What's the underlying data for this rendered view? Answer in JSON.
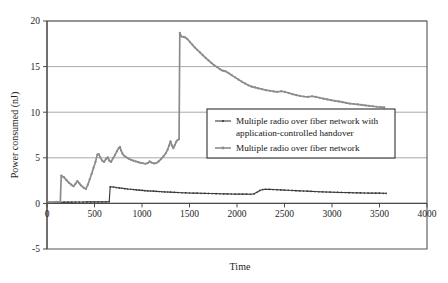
{
  "chart_data": {
    "type": "line",
    "title": "",
    "xlabel": "Time",
    "ylabel": "Power consumed (nJ)",
    "xlim": [
      0,
      4000
    ],
    "ylim": [
      -5,
      20
    ],
    "xticks": [
      0,
      500,
      1000,
      1500,
      2000,
      2500,
      3000,
      3500,
      4000
    ],
    "xtick_labels": [
      "0",
      "500",
      "1000",
      "1500",
      "2000",
      "2500",
      "3000",
      "3500",
      "4000"
    ],
    "yticks": [
      -5,
      0,
      5,
      10,
      15,
      20
    ],
    "ytick_labels": [
      "-5",
      "0",
      "5",
      "10",
      "15",
      "20"
    ],
    "grid": "horizontal",
    "legend_position": "center-right",
    "colors": {
      "series_a": "#3b3b3b",
      "series_b": "#8c8c8c",
      "grid": "#8d8d8d",
      "frame": "#555555",
      "background": "#ffffff"
    },
    "series": [
      {
        "name": "Multiple radio over fiber network with application-controlled handover",
        "marker": "plus",
        "color": "#3b3b3b",
        "points": [
          [
            20,
            0.12
          ],
          [
            60,
            0.12
          ],
          [
            100,
            0.12
          ],
          [
            140,
            0.12
          ],
          [
            180,
            0.14
          ],
          [
            220,
            0.14
          ],
          [
            260,
            0.14
          ],
          [
            300,
            0.15
          ],
          [
            340,
            0.15
          ],
          [
            380,
            0.15
          ],
          [
            420,
            0.16
          ],
          [
            460,
            0.16
          ],
          [
            500,
            0.16
          ],
          [
            540,
            0.17
          ],
          [
            580,
            0.17
          ],
          [
            620,
            0.17
          ],
          [
            655,
            0.18
          ],
          [
            665,
            1.82
          ],
          [
            700,
            1.8
          ],
          [
            730,
            1.74
          ],
          [
            760,
            1.7
          ],
          [
            790,
            1.66
          ],
          [
            820,
            1.62
          ],
          [
            850,
            1.58
          ],
          [
            880,
            1.55
          ],
          [
            910,
            1.52
          ],
          [
            940,
            1.49
          ],
          [
            970,
            1.46
          ],
          [
            1000,
            1.43
          ],
          [
            1030,
            1.4
          ],
          [
            1060,
            1.38
          ],
          [
            1090,
            1.36
          ],
          [
            1120,
            1.34
          ],
          [
            1150,
            1.32
          ],
          [
            1180,
            1.3
          ],
          [
            1210,
            1.28
          ],
          [
            1240,
            1.26
          ],
          [
            1270,
            1.25
          ],
          [
            1300,
            1.23
          ],
          [
            1340,
            1.21
          ],
          [
            1380,
            1.19
          ],
          [
            1420,
            1.17
          ],
          [
            1460,
            1.16
          ],
          [
            1500,
            1.14
          ],
          [
            1540,
            1.13
          ],
          [
            1580,
            1.12
          ],
          [
            1620,
            1.11
          ],
          [
            1660,
            1.1
          ],
          [
            1700,
            1.09
          ],
          [
            1740,
            1.08
          ],
          [
            1780,
            1.07
          ],
          [
            1820,
            1.06
          ],
          [
            1860,
            1.05
          ],
          [
            1900,
            1.04
          ],
          [
            1940,
            1.03
          ],
          [
            1980,
            1.02
          ],
          [
            2020,
            1.02
          ],
          [
            2060,
            1.01
          ],
          [
            2100,
            1.01
          ],
          [
            2140,
            1.0
          ],
          [
            2180,
            1.05
          ],
          [
            2210,
            1.22
          ],
          [
            2240,
            1.42
          ],
          [
            2270,
            1.52
          ],
          [
            2300,
            1.55
          ],
          [
            2340,
            1.54
          ],
          [
            2380,
            1.52
          ],
          [
            2420,
            1.5
          ],
          [
            2460,
            1.48
          ],
          [
            2500,
            1.46
          ],
          [
            2540,
            1.44
          ],
          [
            2580,
            1.42
          ],
          [
            2620,
            1.4
          ],
          [
            2660,
            1.38
          ],
          [
            2700,
            1.36
          ],
          [
            2740,
            1.34
          ],
          [
            2780,
            1.32
          ],
          [
            2820,
            1.3
          ],
          [
            2860,
            1.28
          ],
          [
            2900,
            1.27
          ],
          [
            2940,
            1.25
          ],
          [
            2980,
            1.24
          ],
          [
            3020,
            1.22
          ],
          [
            3060,
            1.21
          ],
          [
            3100,
            1.2
          ],
          [
            3140,
            1.19
          ],
          [
            3180,
            1.18
          ],
          [
            3220,
            1.17
          ],
          [
            3260,
            1.16
          ],
          [
            3300,
            1.15
          ],
          [
            3340,
            1.14
          ],
          [
            3380,
            1.13
          ],
          [
            3420,
            1.13
          ],
          [
            3460,
            1.12
          ],
          [
            3500,
            1.12
          ],
          [
            3540,
            1.11
          ],
          [
            3570,
            1.11
          ]
        ]
      },
      {
        "name": "Multiple radio over fiber network",
        "marker": "plus",
        "color": "#8c8c8c",
        "points": [
          [
            20,
            0.15
          ],
          [
            60,
            0.15
          ],
          [
            100,
            0.16
          ],
          [
            140,
            0.17
          ],
          [
            150,
            3.05
          ],
          [
            180,
            2.85
          ],
          [
            205,
            2.55
          ],
          [
            230,
            2.28
          ],
          [
            255,
            2.05
          ],
          [
            280,
            1.88
          ],
          [
            300,
            2.15
          ],
          [
            320,
            2.45
          ],
          [
            340,
            2.2
          ],
          [
            360,
            1.95
          ],
          [
            385,
            1.72
          ],
          [
            410,
            1.58
          ],
          [
            430,
            2.05
          ],
          [
            450,
            2.65
          ],
          [
            470,
            3.25
          ],
          [
            490,
            3.9
          ],
          [
            510,
            4.55
          ],
          [
            530,
            5.35
          ],
          [
            545,
            5.4
          ],
          [
            560,
            5.05
          ],
          [
            580,
            4.7
          ],
          [
            600,
            4.55
          ],
          [
            620,
            4.85
          ],
          [
            640,
            5.05
          ],
          [
            655,
            4.7
          ],
          [
            675,
            4.55
          ],
          [
            695,
            4.95
          ],
          [
            715,
            5.3
          ],
          [
            735,
            5.7
          ],
          [
            755,
            6.05
          ],
          [
            768,
            6.2
          ],
          [
            780,
            5.8
          ],
          [
            795,
            5.45
          ],
          [
            815,
            5.2
          ],
          [
            835,
            5.05
          ],
          [
            860,
            4.9
          ],
          [
            885,
            4.78
          ],
          [
            910,
            4.68
          ],
          [
            935,
            4.6
          ],
          [
            960,
            4.52
          ],
          [
            985,
            4.45
          ],
          [
            1010,
            4.4
          ],
          [
            1035,
            4.35
          ],
          [
            1060,
            4.42
          ],
          [
            1080,
            4.6
          ],
          [
            1100,
            4.48
          ],
          [
            1125,
            4.38
          ],
          [
            1150,
            4.42
          ],
          [
            1175,
            4.6
          ],
          [
            1200,
            4.85
          ],
          [
            1225,
            5.15
          ],
          [
            1250,
            5.5
          ],
          [
            1270,
            5.9
          ],
          [
            1285,
            6.35
          ],
          [
            1300,
            6.8
          ],
          [
            1315,
            6.35
          ],
          [
            1330,
            6.05
          ],
          [
            1345,
            6.4
          ],
          [
            1360,
            6.75
          ],
          [
            1375,
            6.95
          ],
          [
            1390,
            7.05
          ],
          [
            1398,
            18.7
          ],
          [
            1415,
            18.3
          ],
          [
            1435,
            18.25
          ],
          [
            1455,
            18.2
          ],
          [
            1480,
            18.0
          ],
          [
            1505,
            17.7
          ],
          [
            1530,
            17.4
          ],
          [
            1555,
            17.1
          ],
          [
            1580,
            16.85
          ],
          [
            1610,
            16.55
          ],
          [
            1640,
            16.25
          ],
          [
            1670,
            15.95
          ],
          [
            1700,
            15.68
          ],
          [
            1730,
            15.4
          ],
          [
            1760,
            15.15
          ],
          [
            1790,
            14.95
          ],
          [
            1820,
            14.72
          ],
          [
            1850,
            14.55
          ],
          [
            1880,
            14.48
          ],
          [
            1910,
            14.3
          ],
          [
            1945,
            14.05
          ],
          [
            1980,
            13.82
          ],
          [
            2015,
            13.58
          ],
          [
            2050,
            13.35
          ],
          [
            2085,
            13.15
          ],
          [
            2120,
            12.95
          ],
          [
            2155,
            12.8
          ],
          [
            2190,
            12.72
          ],
          [
            2225,
            12.62
          ],
          [
            2265,
            12.52
          ],
          [
            2305,
            12.42
          ],
          [
            2345,
            12.35
          ],
          [
            2385,
            12.28
          ],
          [
            2425,
            12.22
          ],
          [
            2465,
            12.3
          ],
          [
            2505,
            12.22
          ],
          [
            2545,
            12.1
          ],
          [
            2585,
            11.98
          ],
          [
            2625,
            11.88
          ],
          [
            2665,
            11.78
          ],
          [
            2705,
            11.72
          ],
          [
            2745,
            11.68
          ],
          [
            2790,
            11.75
          ],
          [
            2830,
            11.68
          ],
          [
            2870,
            11.58
          ],
          [
            2910,
            11.48
          ],
          [
            2950,
            11.4
          ],
          [
            2990,
            11.32
          ],
          [
            3030,
            11.25
          ],
          [
            3070,
            11.18
          ],
          [
            3110,
            11.1
          ],
          [
            3150,
            11.02
          ],
          [
            3190,
            10.95
          ],
          [
            3230,
            10.9
          ],
          [
            3270,
            10.85
          ],
          [
            3310,
            10.8
          ],
          [
            3350,
            10.75
          ],
          [
            3390,
            10.7
          ],
          [
            3430,
            10.65
          ],
          [
            3470,
            10.6
          ],
          [
            3510,
            10.56
          ],
          [
            3550,
            10.52
          ]
        ]
      }
    ],
    "legend_entries": [
      {
        "label_lines": [
          "Multiple radio over fiber network with",
          "application-controlled handover"
        ],
        "color": "#3b3b3b"
      },
      {
        "label_lines": [
          "Multiple radio over fiber network"
        ],
        "color": "#8c8c8c"
      }
    ]
  }
}
